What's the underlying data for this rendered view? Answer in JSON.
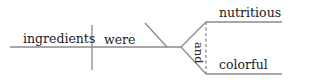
{
  "diagram": {
    "type": "sentence-diagram",
    "subject": "ingredients",
    "verb": "were",
    "compound_complement": {
      "conjunction": "and",
      "items": [
        "nutritious",
        "colorful"
      ]
    },
    "line_color": "#888888",
    "text_color": "#222222"
  }
}
